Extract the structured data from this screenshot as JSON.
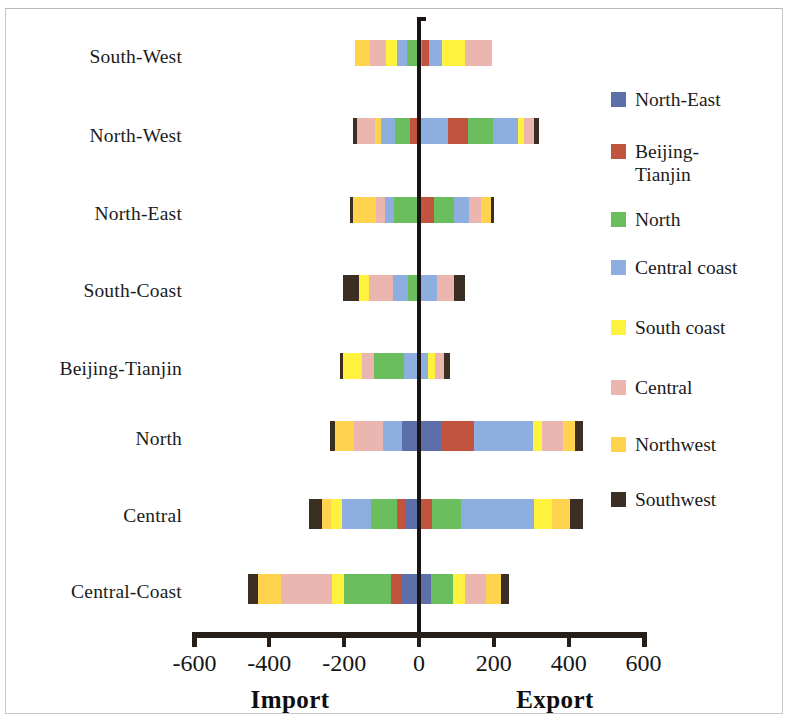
{
  "chart_data": {
    "type": "bar",
    "subtype": "diverging-stacked-horizontal",
    "title": "",
    "xlabel_left": "Import",
    "xlabel_right": "Export",
    "ylabel": "",
    "xlim": [
      -600,
      600
    ],
    "xticks": [
      -600,
      -400,
      -200,
      0,
      200,
      400,
      600
    ],
    "xtick_labels": [
      "-600",
      "-400",
      "-200",
      "0",
      "200",
      "400",
      "600"
    ],
    "grid": false,
    "legend_position": "right",
    "categories": [
      "South-West",
      "North-West",
      "North-East",
      "South-Coast",
      "Beijing-Tianjin",
      "North",
      "Central",
      "Central-Coast"
    ],
    "series": [
      {
        "name": "North-East",
        "color": "#5C6FA8"
      },
      {
        "name": "Beijing-Tianjin",
        "color": "#C0543E"
      },
      {
        "name": "North",
        "color": "#6BBE5E"
      },
      {
        "name": "Central coast",
        "color": "#8FAEE0"
      },
      {
        "name": "South coast",
        "color": "#FFF23F"
      },
      {
        "name": "Central",
        "color": "#EBB6B0"
      },
      {
        "name": "Northwest",
        "color": "#FFD34D"
      },
      {
        "name": "Southwest",
        "color": "#3A2F22"
      }
    ],
    "rows": [
      {
        "category": "South-West",
        "import_total": -170,
        "export_total": 195,
        "import_segments": [
          {
            "series": "Northwest",
            "value": -40
          },
          {
            "series": "Central",
            "value": -43
          },
          {
            "series": "South coast",
            "value": -27
          },
          {
            "series": "Central coast",
            "value": -27
          },
          {
            "series": "North",
            "value": -33
          }
        ],
        "export_segments": [
          {
            "series": "North",
            "value": 8
          },
          {
            "series": "Beijing-Tianjin",
            "value": 19
          },
          {
            "series": "Central coast",
            "value": 35
          },
          {
            "series": "South coast",
            "value": 61
          },
          {
            "series": "Central",
            "value": 72
          }
        ]
      },
      {
        "category": "North-West",
        "import_total": -176,
        "export_total": 320,
        "import_segments": [
          {
            "series": "Southwest",
            "value": -11
          },
          {
            "series": "Central",
            "value": -48
          },
          {
            "series": "Northwest",
            "value": -16
          },
          {
            "series": "Central coast",
            "value": -37
          },
          {
            "series": "North",
            "value": -40
          },
          {
            "series": "Beijing-Tianjin",
            "value": -24
          }
        ],
        "export_segments": [
          {
            "series": "Central coast",
            "value": 77
          },
          {
            "series": "Beijing-Tianjin",
            "value": 53
          },
          {
            "series": "North",
            "value": 67
          },
          {
            "series": "Central coast",
            "value": 67
          },
          {
            "series": "South coast",
            "value": 16
          },
          {
            "series": "Central",
            "value": 27
          },
          {
            "series": "Southwest",
            "value": 13
          }
        ]
      },
      {
        "category": "North-East",
        "import_total": -184,
        "export_total": 200,
        "import_segments": [
          {
            "series": "Southwest",
            "value": -8
          },
          {
            "series": "Northwest",
            "value": -61
          },
          {
            "series": "Central",
            "value": -24
          },
          {
            "series": "Central coast",
            "value": -24
          },
          {
            "series": "North",
            "value": -67
          }
        ],
        "export_segments": [
          {
            "series": "Beijing-Tianjin",
            "value": 40
          },
          {
            "series": "North",
            "value": 53
          },
          {
            "series": "Central coast",
            "value": 40
          },
          {
            "series": "Central",
            "value": 32
          },
          {
            "series": "Northwest",
            "value": 27
          },
          {
            "series": "Southwest",
            "value": 8
          }
        ]
      },
      {
        "category": "South-Coast",
        "import_total": -203,
        "export_total": 123,
        "import_segments": [
          {
            "series": "Southwest",
            "value": -43
          },
          {
            "series": "South coast",
            "value": -27
          },
          {
            "series": "Central",
            "value": -64
          },
          {
            "series": "Central coast",
            "value": -40
          },
          {
            "series": "North",
            "value": -29
          }
        ],
        "export_segments": [
          {
            "series": "Central coast",
            "value": 48
          },
          {
            "series": "Central",
            "value": 45
          },
          {
            "series": "Southwest",
            "value": 30
          }
        ]
      },
      {
        "category": "Beijing-Tianjin",
        "import_total": -211,
        "export_total": 83,
        "import_segments": [
          {
            "series": "Southwest",
            "value": -8
          },
          {
            "series": "South coast",
            "value": -51
          },
          {
            "series": "Central",
            "value": -32
          },
          {
            "series": "North",
            "value": -80
          },
          {
            "series": "Central coast",
            "value": -40
          }
        ],
        "export_segments": [
          {
            "series": "Central coast",
            "value": 24
          },
          {
            "series": "South coast",
            "value": 19
          },
          {
            "series": "Central",
            "value": 24
          },
          {
            "series": "Southwest",
            "value": 16
          }
        ]
      },
      {
        "category": "North",
        "import_total": -237,
        "export_total": 437,
        "import_segments": [
          {
            "series": "Southwest",
            "value": -13
          },
          {
            "series": "Northwest",
            "value": -51
          },
          {
            "series": "Central",
            "value": -77
          },
          {
            "series": "Central coast",
            "value": -51
          },
          {
            "series": "North-East",
            "value": -45
          }
        ],
        "export_segments": [
          {
            "series": "North-East",
            "value": 59
          },
          {
            "series": "Beijing-Tianjin",
            "value": 88
          },
          {
            "series": "Central coast",
            "value": 157
          },
          {
            "series": "South coast",
            "value": 24
          },
          {
            "series": "Central",
            "value": 56
          },
          {
            "series": "Northwest",
            "value": 32
          },
          {
            "series": "Southwest",
            "value": 21
          }
        ]
      },
      {
        "category": "Central",
        "import_total": -293,
        "export_total": 437,
        "import_segments": [
          {
            "series": "Southwest",
            "value": -35
          },
          {
            "series": "Northwest",
            "value": -24
          },
          {
            "series": "South coast",
            "value": -29
          },
          {
            "series": "Central coast",
            "value": -77
          },
          {
            "series": "North",
            "value": -69
          },
          {
            "series": "Beijing-Tianjin",
            "value": -21
          },
          {
            "series": "North-East",
            "value": -38
          }
        ],
        "export_segments": [
          {
            "series": "Beijing-Tianjin",
            "value": 35
          },
          {
            "series": "North",
            "value": 77
          },
          {
            "series": "Central coast",
            "value": 195
          },
          {
            "series": "South coast",
            "value": 48
          },
          {
            "series": "Northwest",
            "value": 48
          },
          {
            "series": "Southwest",
            "value": 34
          }
        ]
      },
      {
        "category": "Central-Coast",
        "import_total": -456,
        "export_total": 240,
        "import_segments": [
          {
            "series": "Southwest",
            "value": -27
          },
          {
            "series": "Northwest",
            "value": -61
          },
          {
            "series": "Central",
            "value": -136
          },
          {
            "series": "South coast",
            "value": -32
          },
          {
            "series": "North",
            "value": -125
          },
          {
            "series": "Beijing-Tianjin",
            "value": -27
          },
          {
            "series": "North-East",
            "value": -48
          }
        ],
        "export_segments": [
          {
            "series": "North-East",
            "value": 32
          },
          {
            "series": "North",
            "value": 59
          },
          {
            "series": "South coast",
            "value": 32
          },
          {
            "series": "Central",
            "value": 56
          },
          {
            "series": "Northwest",
            "value": 40
          },
          {
            "series": "Southwest",
            "value": 21
          }
        ]
      }
    ]
  },
  "axis": {
    "tick_labels": [
      "-600",
      "-400",
      "-200",
      "0",
      "200",
      "400",
      "600"
    ],
    "import_title": "Import",
    "export_title": "Export"
  },
  "legend": {
    "items": [
      {
        "label": "North-East",
        "color": "#5C6FA8"
      },
      {
        "label": "Beijing-\nTianjin",
        "color": "#C0543E"
      },
      {
        "label": "North",
        "color": "#6BBE5E"
      },
      {
        "label": "Central coast",
        "color": "#8FAEE0"
      },
      {
        "label": "South coast",
        "color": "#FFF23F"
      },
      {
        "label": "Central",
        "color": "#EBB6B0"
      },
      {
        "label": "Northwest",
        "color": "#FFD34D"
      },
      {
        "label": "Southwest",
        "color": "#3A2F22"
      }
    ]
  }
}
